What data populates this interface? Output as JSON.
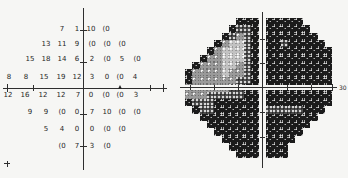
{
  "chart_data": {
    "type": "heatmap",
    "title": "",
    "axis_label_right": "30",
    "numeric_plot": {
      "rows": [
        {
          "y": 30,
          "points": [
            {
              "x": 62,
              "v": "7"
            },
            {
              "x": 77,
              "v": "1"
            },
            {
              "x": 91,
              "v": "10"
            },
            {
              "x": 106,
              "v": "(0"
            }
          ]
        },
        {
          "y": 45,
          "points": [
            {
              "x": 46,
              "v": "13"
            },
            {
              "x": 62,
              "v": "11"
            },
            {
              "x": 77,
              "v": "9"
            },
            {
              "x": 92,
              "v": "(0"
            },
            {
              "x": 107,
              "v": "(0"
            },
            {
              "x": 122,
              "v": "(0"
            }
          ]
        },
        {
          "y": 60,
          "points": [
            {
              "x": 30,
              "v": "15"
            },
            {
              "x": 46,
              "v": "18"
            },
            {
              "x": 62,
              "v": "14"
            },
            {
              "x": 77,
              "v": "6"
            },
            {
              "x": 92,
              "v": "2"
            },
            {
              "x": 107,
              "v": "(0"
            },
            {
              "x": 122,
              "v": "5"
            },
            {
              "x": 137,
              "v": "(0"
            }
          ]
        },
        {
          "y": 78,
          "points": [
            {
              "x": 9,
              "v": "8"
            },
            {
              "x": 26,
              "v": "8"
            },
            {
              "x": 44,
              "v": "15"
            },
            {
              "x": 61,
              "v": "19"
            },
            {
              "x": 77,
              "v": "12"
            },
            {
              "x": 92,
              "v": "3"
            },
            {
              "x": 107,
              "v": "0"
            },
            {
              "x": 120,
              "v": "(0"
            },
            {
              "x": 135,
              "v": "4"
            }
          ]
        },
        {
          "y": 96,
          "points": [
            {
              "x": 8,
              "v": "12"
            },
            {
              "x": 25,
              "v": "16"
            },
            {
              "x": 43,
              "v": "12"
            },
            {
              "x": 61,
              "v": "12"
            },
            {
              "x": 78,
              "v": "7"
            },
            {
              "x": 91,
              "v": "0"
            },
            {
              "x": 106,
              "v": "(0"
            },
            {
              "x": 120,
              "v": "(0"
            },
            {
              "x": 136,
              "v": "3"
            }
          ]
        },
        {
          "y": 113,
          "points": [
            {
              "x": 30,
              "v": "9"
            },
            {
              "x": 46,
              "v": "9"
            },
            {
              "x": 62,
              "v": "(0"
            },
            {
              "x": 77,
              "v": "0"
            },
            {
              "x": 92,
              "v": "7"
            },
            {
              "x": 107,
              "v": "10"
            },
            {
              "x": 122,
              "v": "(0"
            },
            {
              "x": 137,
              "v": "(0"
            }
          ]
        },
        {
          "y": 130,
          "points": [
            {
              "x": 46,
              "v": "5"
            },
            {
              "x": 62,
              "v": "4"
            },
            {
              "x": 77,
              "v": "0"
            },
            {
              "x": 92,
              "v": "0"
            },
            {
              "x": 107,
              "v": "(0"
            },
            {
              "x": 122,
              "v": "(0"
            }
          ]
        },
        {
          "y": 147,
          "points": [
            {
              "x": 62,
              "v": "(0"
            },
            {
              "x": 77,
              "v": "7"
            },
            {
              "x": 92,
              "v": "3"
            },
            {
              "x": 107,
              "v": "(0"
            }
          ]
        }
      ]
    },
    "greyscale_grid": [
      ".......kkk.kkkkk....",
      "......kddk.kkkkkk...",
      ".....kdmdk.kkkkkkk..",
      "....kmLLdk.kkdkkkkk.",
      "...kmLLLdk.kkkkkkkkk",
      "..kmmLLLdk.kkkkkkkkk",
      ".kmmmLLmdk.kkkkkkkkk",
      "kmmmmLmmdk.kkkkkkkkk",
      "kmmmmmmddk.kkkkkkkkk",
      "mmmmmmddkk.kkkkkkkkk",
      "mmmdddddkk.kkkkkkkkk",
      "kdddkkkkkk.kkkkkkkkk",
      ".kddkkkkkk.dddddkkk.",
      "..kkkkkkkk.kkkkkkk..",
      "...kkkkkkk.kkkkkk...",
      "....kkkkkk.kkkkk....",
      ".....kkkkk.kkkk.....",
      "......kkkk.kkk......",
      ".......kkk.kkk......"
    ],
    "tones": {
      "k": "#1b1b1b",
      "d": "#4f4f4f",
      "m": "#9a9a9a",
      "L": "#c2c2c2",
      "background": "#f6f6f4",
      "ink": "#2e2e2e"
    }
  }
}
